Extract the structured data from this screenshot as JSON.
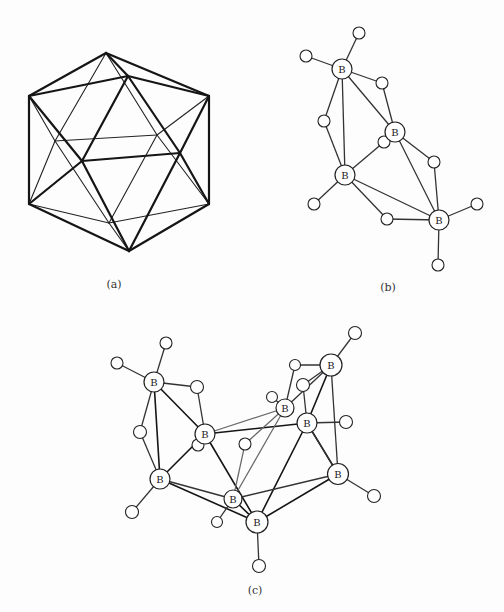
{
  "figure": {
    "panels": [
      {
        "id": "a",
        "label": "(a)",
        "description": "Icosahedron wireframe (B12 framework)"
      },
      {
        "id": "b",
        "label": "(b)",
        "description": "Borane with 4 boron atoms and 10 hydrogen atoms",
        "boron_label": "B",
        "boron_count": 4,
        "hydrogen_count": 10
      },
      {
        "id": "c",
        "label": "(c)",
        "description": "Borane with 8 boron atoms and 14 hydrogen atoms",
        "boron_label": "B",
        "boron_count": 8,
        "hydrogen_count": 14
      }
    ]
  }
}
